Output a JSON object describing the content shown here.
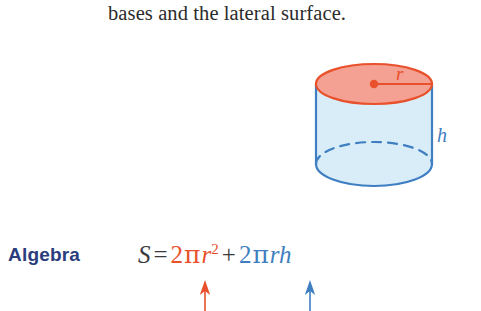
{
  "lesson": {
    "text": "bases and the lateral surface."
  },
  "figure": {
    "name": "cylinder-diagram",
    "radius_label": "r",
    "height_label": "h",
    "colors": {
      "top_face_fill": "#f4a093",
      "top_face_stroke": "#e8512b",
      "body_fill": "#d9edf9",
      "body_stroke": "#3f7fc1",
      "radius_line": "#e8512b",
      "center_dot": "#e8512b",
      "hidden_edge": "#3f7fc1"
    }
  },
  "algebra": {
    "label": "Algebra",
    "label_color": "#2b3d7d",
    "formula": {
      "subject": "S",
      "equals": "=",
      "term_bases": {
        "coefficient": "2",
        "pi": "π",
        "variable": "r",
        "exponent": "2",
        "color": "#e8512b"
      },
      "plus": "+",
      "term_lateral": {
        "coefficient": "2",
        "pi": "π",
        "variable_r": "r",
        "variable_h": "h",
        "color": "#3f7fc1"
      }
    }
  },
  "annotations": {
    "arrow_bases_color": "#e8512b",
    "arrow_lateral_color": "#3f7fc1"
  }
}
